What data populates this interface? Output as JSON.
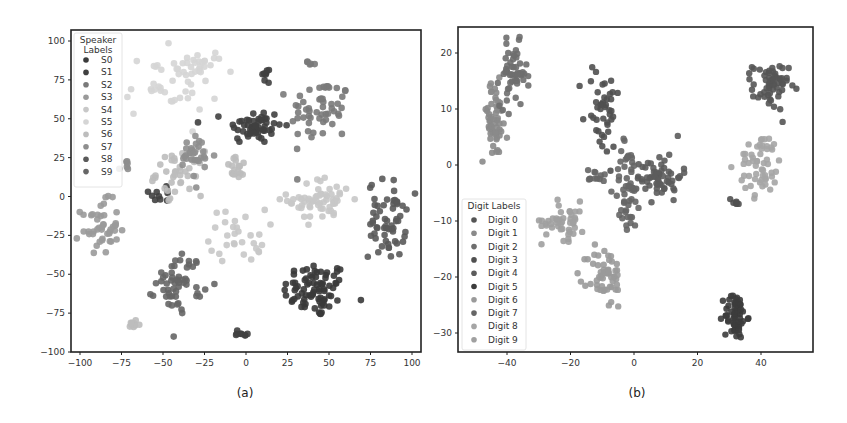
{
  "chart_data": [
    {
      "type": "scatter",
      "panel": "a",
      "caption": "(a)",
      "title": "",
      "xlabel": "",
      "ylabel": "",
      "xlim": [
        -105,
        105
      ],
      "ylim": [
        -102,
        105
      ],
      "xticks": [
        -100,
        -75,
        -50,
        -25,
        0,
        25,
        50,
        75,
        100
      ],
      "yticks": [
        100,
        75,
        50,
        25,
        0,
        -25,
        -50,
        -75,
        -100
      ],
      "grid": false,
      "legend": {
        "title": "Speaker Labels",
        "title_lines": [
          "Speaker",
          "Labels"
        ],
        "placement": "top-left",
        "entries": [
          "S0",
          "S1",
          "S2",
          "S3",
          "S4",
          "S5",
          "S6",
          "S7",
          "S8",
          "S9"
        ]
      },
      "series": [
        {
          "name": "S0",
          "color": "#3a3a3a",
          "clusters": [
            {
              "cx": 42,
              "cy": -60,
              "sx": 14,
              "sy": 13,
              "n": 80
            }
          ]
        },
        {
          "name": "S1",
          "color": "#404040",
          "clusters": [
            {
              "cx": 5,
              "cy": 45,
              "sx": 12,
              "sy": 8,
              "n": 55
            },
            {
              "cx": 12,
              "cy": 78,
              "sx": 3,
              "sy": 4,
              "n": 8
            },
            {
              "cx": -50,
              "cy": 2,
              "sx": 6,
              "sy": 5,
              "n": 10
            },
            {
              "cx": -3,
              "cy": -88,
              "sx": 4,
              "sy": 3,
              "n": 8
            }
          ]
        },
        {
          "name": "S2",
          "color": "#7a7a7a",
          "clusters": [
            {
              "cx": 45,
              "cy": 55,
              "sx": 13,
              "sy": 15,
              "n": 55
            },
            {
              "cx": 39,
              "cy": 86,
              "sx": 2,
              "sy": 3,
              "n": 5
            }
          ]
        },
        {
          "name": "S3",
          "color": "#9a9a9a",
          "clusters": [
            {
              "cx": -88,
              "cy": -20,
              "sx": 8,
              "sy": 12,
              "n": 45
            }
          ]
        },
        {
          "name": "S4",
          "color": "#c8c8c8",
          "clusters": [
            {
              "cx": 45,
              "cy": -2,
              "sx": 14,
              "sy": 10,
              "n": 60
            },
            {
              "cx": -5,
              "cy": -25,
              "sx": 12,
              "sy": 12,
              "n": 30
            }
          ]
        },
        {
          "name": "S5",
          "color": "#d5d5d5",
          "clusters": [
            {
              "cx": -45,
              "cy": 72,
              "sx": 20,
              "sy": 15,
              "n": 45
            },
            {
              "cx": -25,
              "cy": 85,
              "sx": 8,
              "sy": 6,
              "n": 15
            }
          ]
        },
        {
          "name": "S6",
          "color": "#bdbdbd",
          "clusters": [
            {
              "cx": -40,
              "cy": 15,
              "sx": 10,
              "sy": 10,
              "n": 40
            },
            {
              "cx": -5,
              "cy": 18,
              "sx": 5,
              "sy": 5,
              "n": 18
            },
            {
              "cx": -68,
              "cy": -82,
              "sx": 3,
              "sy": 3,
              "n": 10
            }
          ]
        },
        {
          "name": "S7",
          "color": "#8e8e8e",
          "clusters": [
            {
              "cx": -30,
              "cy": 25,
              "sx": 8,
              "sy": 10,
              "n": 30
            },
            {
              "cx": -72,
              "cy": 20,
              "sx": 3,
              "sy": 3,
              "n": 6
            }
          ]
        },
        {
          "name": "S8",
          "color": "#5a5a5a",
          "clusters": [
            {
              "cx": 85,
              "cy": -15,
              "sx": 8,
              "sy": 18,
              "n": 60
            }
          ]
        },
        {
          "name": "S9",
          "color": "#666666",
          "clusters": [
            {
              "cx": -40,
              "cy": -55,
              "sx": 10,
              "sy": 13,
              "n": 55
            }
          ]
        }
      ]
    },
    {
      "type": "scatter",
      "panel": "b",
      "caption": "(b)",
      "title": "",
      "xlabel": "",
      "ylabel": "",
      "xlim": [
        -54,
        57
      ],
      "ylim": [
        -34,
        26
      ],
      "xticks": [
        -40,
        -20,
        0,
        20,
        40
      ],
      "yticks": [
        20,
        10,
        0,
        -10,
        -20,
        -30
      ],
      "grid": false,
      "legend": {
        "title": "Digit Labels",
        "placement": "lower-left",
        "entries": [
          "Digit 0",
          "Digit 1",
          "Digit 2",
          "Digit 3",
          "Digit 4",
          "Digit 5",
          "Digit 6",
          "Digit 7",
          "Digit 8",
          "Digit 9"
        ]
      },
      "series": [
        {
          "name": "Digit 0",
          "color": "#555555",
          "clusters": [
            {
              "cx": 43,
              "cy": 14,
              "sx": 4,
              "sy": 3,
              "n": 60
            }
          ]
        },
        {
          "name": "Digit 1",
          "color": "#8a8a8a",
          "clusters": [
            {
              "cx": -44,
              "cy": 8,
              "sx": 3,
              "sy": 5,
              "n": 55
            }
          ]
        },
        {
          "name": "Digit 2",
          "color": "#6e6e6e",
          "clusters": [
            {
              "cx": -38,
              "cy": 16,
              "sx": 3,
              "sy": 4,
              "n": 55
            }
          ]
        },
        {
          "name": "Digit 3",
          "color": "#505050",
          "clusters": [
            {
              "cx": -10,
              "cy": 10,
              "sx": 4,
              "sy": 6,
              "n": 45
            },
            {
              "cx": 32,
              "cy": -6.5,
              "sx": 1.5,
              "sy": 0.5,
              "n": 6
            }
          ]
        },
        {
          "name": "Digit 4",
          "color": "#5c5c5c",
          "clusters": [
            {
              "cx": 8,
              "cy": -2,
              "sx": 5,
              "sy": 3,
              "n": 60
            }
          ]
        },
        {
          "name": "Digit 5",
          "color": "#3c3c3c",
          "clusters": [
            {
              "cx": 32,
              "cy": -27,
              "sx": 2.5,
              "sy": 3,
              "n": 60
            }
          ]
        },
        {
          "name": "Digit 6",
          "color": "#9a9a9a",
          "clusters": [
            {
              "cx": -9,
              "cy": -20,
              "sx": 4,
              "sy": 4,
              "n": 55
            }
          ]
        },
        {
          "name": "Digit 7",
          "color": "#666666",
          "clusters": [
            {
              "cx": -2,
              "cy": -4,
              "sx": 3,
              "sy": 6,
              "n": 50
            },
            {
              "cx": -12,
              "cy": -2,
              "sx": 3,
              "sy": 1,
              "n": 12
            }
          ]
        },
        {
          "name": "Digit 8",
          "color": "#a5a5a5",
          "clusters": [
            {
              "cx": 40,
              "cy": 0,
              "sx": 5,
              "sy": 4,
              "n": 55
            }
          ]
        },
        {
          "name": "Digit 9",
          "color": "#a0a0a0",
          "clusters": [
            {
              "cx": -22,
              "cy": -10,
              "sx": 5,
              "sy": 2.5,
              "n": 45
            }
          ]
        }
      ]
    }
  ]
}
